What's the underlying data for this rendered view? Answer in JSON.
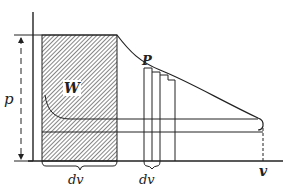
{
  "diagram": {
    "labels": {
      "p": "p",
      "W": "W",
      "P": "P",
      "dv_left": "dv",
      "dv_right": "dv",
      "v": "v"
    },
    "colors": {
      "ink": "#222222",
      "hatch": "#333333",
      "background": "#ffffff"
    }
  }
}
